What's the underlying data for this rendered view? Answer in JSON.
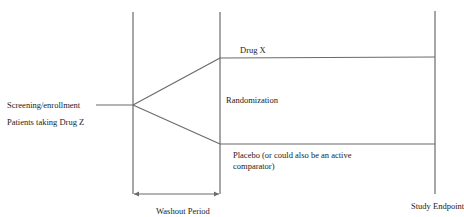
{
  "diagram": {
    "labels": {
      "screening": "Screening/enrollment",
      "patients": "Patients taking Drug Z",
      "drug_x": "Drug X",
      "randomization": "Randomization",
      "placebo_line1": "Placebo (or could also be an active",
      "placebo_line2": "comparator)",
      "washout": "Washout Period",
      "endpoint": "Study Endpoint"
    },
    "colors": {
      "line": "#6b6b6b",
      "text": "#222222"
    }
  }
}
